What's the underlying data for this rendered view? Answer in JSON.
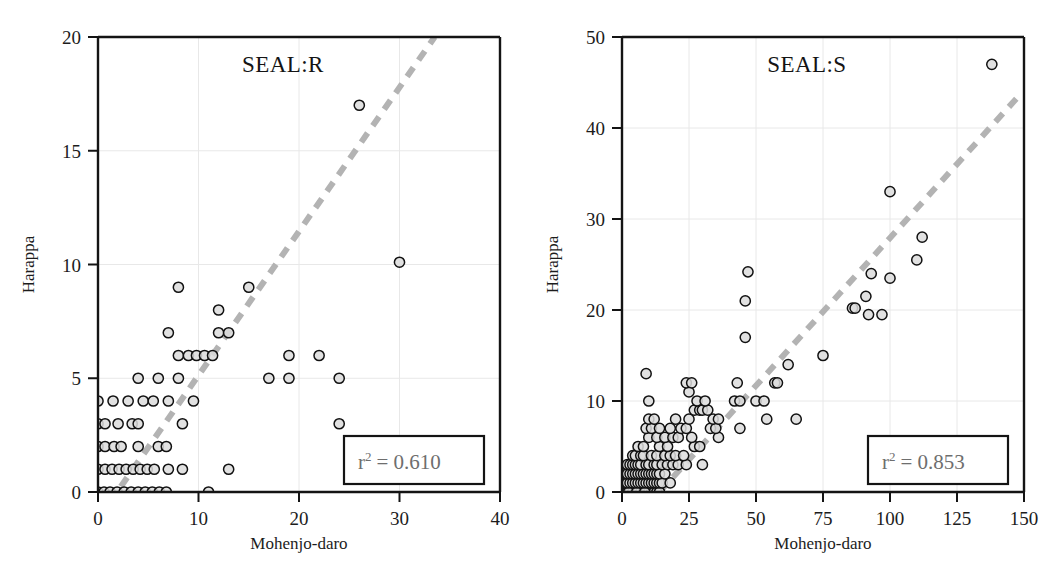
{
  "figure": {
    "background": "#ffffff",
    "panel_count": 2
  },
  "style": {
    "marker_fill": "#dcdcdc",
    "marker_stroke": "#111111",
    "trend_color": "#b3b3b3",
    "grid_color": "#e8e8e8",
    "frame_color": "#141414",
    "annotation_text_color": "#6e6e6e"
  },
  "chart_data": [
    {
      "type": "scatter",
      "title": "SEAL:R",
      "xlabel": "Mohenjo-daro",
      "ylabel": "Harappa",
      "xlim": [
        0,
        40
      ],
      "ylim": [
        0,
        20
      ],
      "xticks": [
        0,
        10,
        20,
        30,
        40
      ],
      "yticks": [
        0,
        5,
        10,
        15,
        20
      ],
      "xticklabels": [
        "0",
        "10",
        "20",
        "30",
        "40"
      ],
      "yticklabels": [
        "0",
        "5",
        "10",
        "15",
        "20"
      ],
      "grid": true,
      "legend": "none",
      "annotation": {
        "label": "r",
        "exponent": "2",
        "equals": "= 0.610",
        "full_text": "r2 = 0.610",
        "r_squared": 0.61,
        "boxed": true
      },
      "trendline": {
        "style": "dashed",
        "x_start": 0.0,
        "y_start": -1.2,
        "x_end": 33.5,
        "y_end": 20.0
      },
      "points": [
        [
          0,
          0
        ],
        [
          0.6,
          0
        ],
        [
          1.2,
          0
        ],
        [
          1.9,
          0
        ],
        [
          2.6,
          0
        ],
        [
          3.3,
          0
        ],
        [
          4.0,
          0
        ],
        [
          4.7,
          0
        ],
        [
          5.4,
          0
        ],
        [
          6.1,
          0
        ],
        [
          6.8,
          0
        ],
        [
          11.0,
          0
        ],
        [
          0,
          1
        ],
        [
          0.7,
          1
        ],
        [
          1.4,
          1
        ],
        [
          2.1,
          1
        ],
        [
          2.8,
          1
        ],
        [
          3.5,
          1
        ],
        [
          4.2,
          1
        ],
        [
          4.9,
          1
        ],
        [
          5.6,
          1
        ],
        [
          7.0,
          1
        ],
        [
          8.4,
          1
        ],
        [
          13.0,
          1
        ],
        [
          0,
          2
        ],
        [
          0.7,
          2
        ],
        [
          1.6,
          2
        ],
        [
          2.3,
          2
        ],
        [
          4.0,
          2
        ],
        [
          6.0,
          2
        ],
        [
          6.8,
          2
        ],
        [
          0,
          3
        ],
        [
          0.7,
          3
        ],
        [
          2.0,
          3
        ],
        [
          3.4,
          3
        ],
        [
          4.0,
          3
        ],
        [
          8.4,
          3
        ],
        [
          24.0,
          3
        ],
        [
          0,
          4
        ],
        [
          1.5,
          4
        ],
        [
          3.0,
          4
        ],
        [
          4.5,
          4
        ],
        [
          5.5,
          4
        ],
        [
          7.0,
          4
        ],
        [
          9.5,
          4
        ],
        [
          4.0,
          5
        ],
        [
          6.0,
          5
        ],
        [
          8.0,
          5
        ],
        [
          17.0,
          5
        ],
        [
          24.0,
          5
        ],
        [
          19.0,
          5
        ],
        [
          8.0,
          6
        ],
        [
          9.0,
          6
        ],
        [
          9.8,
          6
        ],
        [
          10.6,
          6
        ],
        [
          11.4,
          6
        ],
        [
          19.0,
          6
        ],
        [
          22.0,
          6
        ],
        [
          7.0,
          7
        ],
        [
          12.0,
          7
        ],
        [
          13.0,
          7
        ],
        [
          12.0,
          8
        ],
        [
          8.0,
          9
        ],
        [
          15.0,
          9
        ],
        [
          30.0,
          10.1
        ],
        [
          26.0,
          17.0
        ]
      ]
    },
    {
      "type": "scatter",
      "title": "SEAL:S",
      "xlabel": "Mohenjo-daro",
      "ylabel": "Harappa",
      "xlim": [
        0,
        150
      ],
      "ylim": [
        0,
        50
      ],
      "xticks": [
        0,
        25,
        50,
        75,
        100,
        125,
        150
      ],
      "yticks": [
        0,
        10,
        20,
        30,
        40,
        50
      ],
      "xticklabels": [
        "0",
        "25",
        "50",
        "75",
        "100",
        "125",
        "150"
      ],
      "yticklabels": [
        "0",
        "10",
        "20",
        "30",
        "40",
        "50"
      ],
      "grid": true,
      "legend": "none",
      "annotation": {
        "label": "r",
        "exponent": "2",
        "equals": "= 0.853",
        "full_text": "r2 = 0.853",
        "r_squared": 0.853,
        "boxed": true
      },
      "trendline": {
        "style": "dashed",
        "x_start": 14.0,
        "y_start": 0.0,
        "x_end": 148.0,
        "y_end": 43.5
      },
      "points": [
        [
          1,
          0
        ],
        [
          2,
          0
        ],
        [
          3,
          0
        ],
        [
          4,
          0
        ],
        [
          5,
          0
        ],
        [
          6,
          0
        ],
        [
          7,
          0
        ],
        [
          8,
          0
        ],
        [
          9,
          0
        ],
        [
          10,
          0
        ],
        [
          11,
          0
        ],
        [
          12,
          0
        ],
        [
          13,
          0
        ],
        [
          14,
          0
        ],
        [
          2.5,
          0
        ],
        [
          5.5,
          0
        ],
        [
          8.5,
          0
        ],
        [
          1,
          1
        ],
        [
          2,
          1
        ],
        [
          3,
          1
        ],
        [
          4,
          1
        ],
        [
          5,
          1
        ],
        [
          6,
          1
        ],
        [
          7,
          1
        ],
        [
          8,
          1
        ],
        [
          9,
          1
        ],
        [
          10,
          1
        ],
        [
          11,
          1
        ],
        [
          12,
          1
        ],
        [
          13,
          1
        ],
        [
          14,
          1
        ],
        [
          15,
          1
        ],
        [
          18,
          1
        ],
        [
          1,
          2
        ],
        [
          2,
          2
        ],
        [
          3,
          2
        ],
        [
          4,
          2
        ],
        [
          5,
          2
        ],
        [
          6,
          2
        ],
        [
          7,
          2
        ],
        [
          8,
          2
        ],
        [
          9,
          2
        ],
        [
          10,
          2
        ],
        [
          11,
          2
        ],
        [
          12,
          2
        ],
        [
          13,
          2
        ],
        [
          14,
          2
        ],
        [
          16,
          2
        ],
        [
          2,
          3
        ],
        [
          3,
          3
        ],
        [
          4,
          3
        ],
        [
          5,
          3
        ],
        [
          6,
          3
        ],
        [
          7,
          3
        ],
        [
          9,
          3
        ],
        [
          10,
          3
        ],
        [
          12,
          3
        ],
        [
          13,
          3
        ],
        [
          15,
          3
        ],
        [
          17,
          3
        ],
        [
          19,
          3
        ],
        [
          21,
          3
        ],
        [
          24,
          3
        ],
        [
          30,
          3
        ],
        [
          4,
          4
        ],
        [
          5,
          4
        ],
        [
          7,
          4
        ],
        [
          8,
          4
        ],
        [
          11,
          4
        ],
        [
          13,
          4
        ],
        [
          16,
          4
        ],
        [
          18,
          4
        ],
        [
          20,
          4
        ],
        [
          23,
          4
        ],
        [
          6,
          5
        ],
        [
          8,
          5
        ],
        [
          14,
          5
        ],
        [
          17,
          5
        ],
        [
          27,
          5
        ],
        [
          29,
          5
        ],
        [
          10,
          6
        ],
        [
          13,
          6
        ],
        [
          16,
          6
        ],
        [
          19,
          6
        ],
        [
          21,
          6
        ],
        [
          26,
          6
        ],
        [
          36,
          6
        ],
        [
          9,
          7
        ],
        [
          11,
          7
        ],
        [
          14,
          7
        ],
        [
          18,
          7
        ],
        [
          22,
          7
        ],
        [
          24,
          7
        ],
        [
          33,
          7
        ],
        [
          35,
          7
        ],
        [
          44,
          7
        ],
        [
          10,
          8
        ],
        [
          12,
          8
        ],
        [
          20,
          8
        ],
        [
          25,
          8
        ],
        [
          34,
          8
        ],
        [
          36,
          8
        ],
        [
          54,
          8
        ],
        [
          65,
          8
        ],
        [
          27,
          9
        ],
        [
          29,
          9
        ],
        [
          30,
          9
        ],
        [
          32,
          9
        ],
        [
          10,
          10
        ],
        [
          28,
          10
        ],
        [
          31,
          10
        ],
        [
          42,
          10
        ],
        [
          44,
          10
        ],
        [
          50,
          10
        ],
        [
          53,
          10
        ],
        [
          25,
          11
        ],
        [
          24,
          12
        ],
        [
          26,
          12
        ],
        [
          43,
          12
        ],
        [
          57,
          12
        ],
        [
          58,
          12
        ],
        [
          9,
          13
        ],
        [
          62,
          14
        ],
        [
          75,
          15
        ],
        [
          46,
          17
        ],
        [
          92,
          19.5
        ],
        [
          97,
          19.5
        ],
        [
          86,
          20.2
        ],
        [
          87,
          20.2
        ],
        [
          46,
          21
        ],
        [
          91,
          21.5
        ],
        [
          93,
          24
        ],
        [
          47,
          24.2
        ],
        [
          100,
          23.5
        ],
        [
          110,
          25.5
        ],
        [
          112,
          28
        ],
        [
          100,
          33
        ],
        [
          138,
          47
        ]
      ]
    }
  ]
}
